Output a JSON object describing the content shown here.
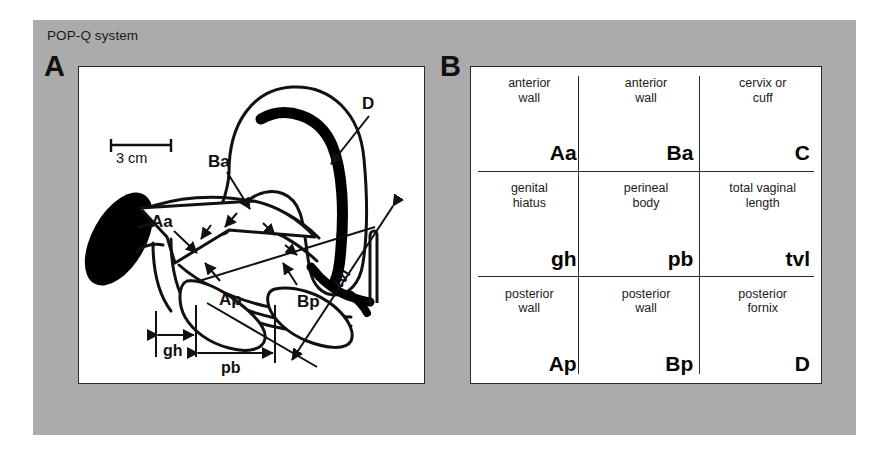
{
  "figure": {
    "title": "POP-Q system",
    "background_color": "#ababab",
    "panel_bg": "#ffffff",
    "ink_color": "#111111"
  },
  "panel_a": {
    "letter": "A",
    "scale_bar": {
      "label": "3 cm"
    },
    "labels": [
      {
        "id": "label-ba",
        "text": "Ba"
      },
      {
        "id": "label-aa",
        "text": "Aa"
      },
      {
        "id": "label-d",
        "text": "D"
      },
      {
        "id": "label-bp",
        "text": "Bp"
      },
      {
        "id": "label-ap",
        "text": "Ap"
      }
    ],
    "dimensions": [
      {
        "id": "dim-gh",
        "text": "gh"
      },
      {
        "id": "dim-pb",
        "text": "pb"
      },
      {
        "id": "dim-tvl",
        "text": "tvl"
      }
    ]
  },
  "panel_b": {
    "letter": "B",
    "rows": [
      {
        "cells": [
          {
            "description": "anterior\nwall",
            "code": "Aa"
          },
          {
            "description": "anterior\nwall",
            "code": "Ba"
          },
          {
            "description": "cervix or\ncuff",
            "code": "C"
          }
        ]
      },
      {
        "cells": [
          {
            "description": "genital\nhiatus",
            "code": "gh"
          },
          {
            "description": "perineal\nbody",
            "code": "pb"
          },
          {
            "description": "total vaginal\nlength",
            "code": "tvl"
          }
        ]
      },
      {
        "cells": [
          {
            "description": "posterior\nwall",
            "code": "Ap"
          },
          {
            "description": "posterior\nwall",
            "code": "Bp"
          },
          {
            "description": "posterior\nfornix",
            "code": "D"
          }
        ]
      }
    ]
  }
}
